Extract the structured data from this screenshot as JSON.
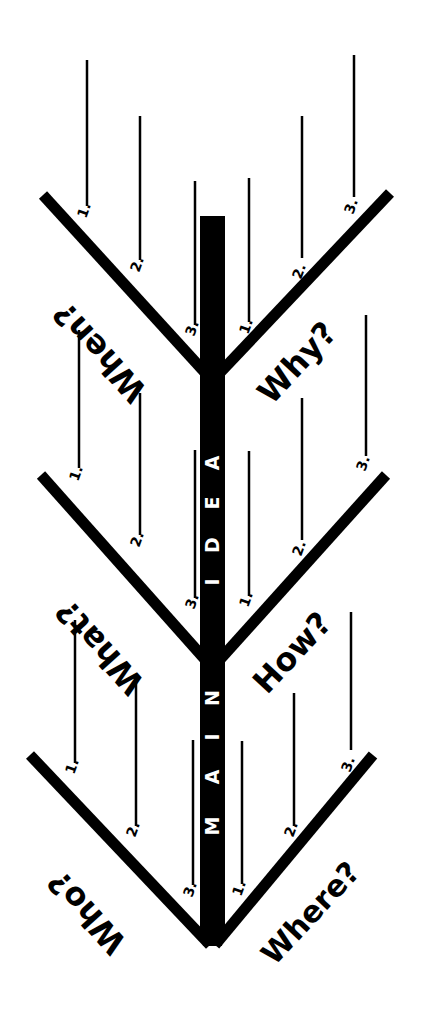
{
  "diagram": {
    "colors": {
      "ink": "#000000",
      "paper": "#ffffff",
      "spine_text": "#ffffff"
    },
    "spine": {
      "text": "MAIN IDEA",
      "letters_main": [
        "M",
        "A",
        "I",
        "N"
      ],
      "letters_idea": [
        "I",
        "D",
        "E",
        "A"
      ]
    },
    "tiers": [
      {
        "left": {
          "label": "When?",
          "numbers": [
            "1.",
            "2.",
            "3."
          ]
        },
        "right": {
          "label": "Why?",
          "numbers": [
            "1.",
            "2.",
            "3."
          ]
        }
      },
      {
        "left": {
          "label": "What?",
          "numbers": [
            "1.",
            "2.",
            "3."
          ]
        },
        "right": {
          "label": "How?",
          "numbers": [
            "1.",
            "2.",
            "3."
          ]
        }
      },
      {
        "left": {
          "label": "Who?",
          "numbers": [
            "1.",
            "2.",
            "3."
          ]
        },
        "right": {
          "label": "Where?",
          "numbers": [
            "1.",
            "2.",
            "3."
          ]
        }
      }
    ]
  }
}
